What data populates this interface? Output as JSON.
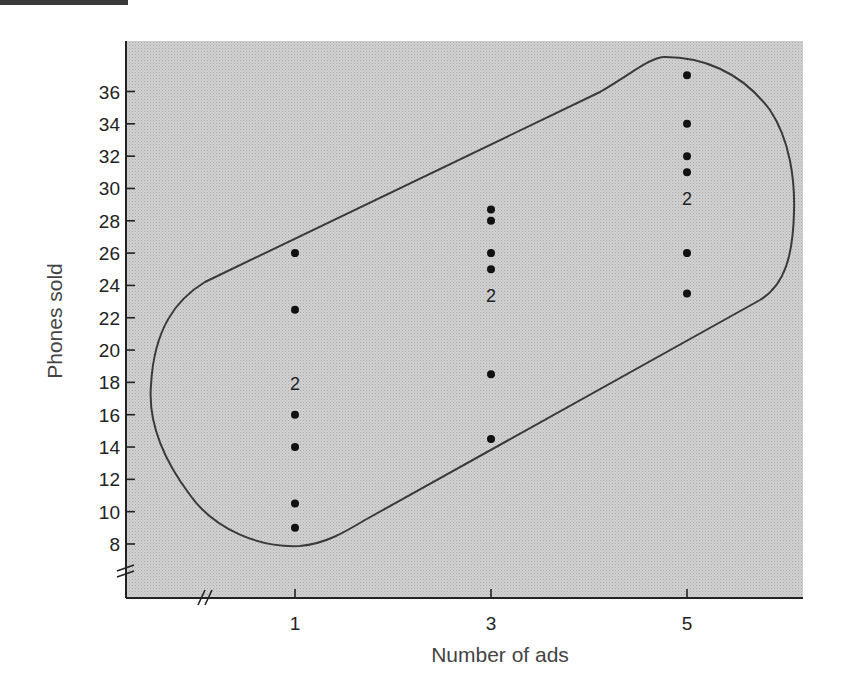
{
  "chart_data": {
    "type": "scatter",
    "title": "",
    "xlabel": "Number of ads",
    "ylabel": "Phones sold",
    "x_ticks": [
      1,
      3,
      5
    ],
    "y_ticks": [
      8,
      10,
      12,
      14,
      16,
      18,
      20,
      22,
      24,
      26,
      28,
      30,
      32,
      34,
      36
    ],
    "xlim": [
      -0.7,
      6.15
    ],
    "ylim": [
      3.4,
      39.1
    ],
    "axis_breaks": {
      "x": true,
      "y": true
    },
    "grid": false,
    "legend": null,
    "background": "stippled gray",
    "enclosure": "rounded oval outline enclosing all points, tilted upward to the right",
    "points": [
      {
        "x": 1,
        "y": 26,
        "count": 1
      },
      {
        "x": 1,
        "y": 22.5,
        "count": 1
      },
      {
        "x": 1,
        "y": 18,
        "count": 2
      },
      {
        "x": 1,
        "y": 16,
        "count": 1
      },
      {
        "x": 1,
        "y": 14,
        "count": 1
      },
      {
        "x": 1,
        "y": 10.5,
        "count": 1
      },
      {
        "x": 1,
        "y": 9,
        "count": 1
      },
      {
        "x": 3,
        "y": 28.7,
        "count": 1
      },
      {
        "x": 3,
        "y": 28,
        "count": 1
      },
      {
        "x": 3,
        "y": 26,
        "count": 1
      },
      {
        "x": 3,
        "y": 25,
        "count": 1
      },
      {
        "x": 3,
        "y": 23.5,
        "count": 2
      },
      {
        "x": 3,
        "y": 18.5,
        "count": 1
      },
      {
        "x": 3,
        "y": 14.5,
        "count": 1
      },
      {
        "x": 5,
        "y": 37,
        "count": 1
      },
      {
        "x": 5,
        "y": 34,
        "count": 1
      },
      {
        "x": 5,
        "y": 32,
        "count": 1
      },
      {
        "x": 5,
        "y": 31,
        "count": 1
      },
      {
        "x": 5,
        "y": 29.5,
        "count": 2
      },
      {
        "x": 5,
        "y": 26,
        "count": 1
      },
      {
        "x": 5,
        "y": 23.5,
        "count": 1
      }
    ],
    "annotations": [
      "2",
      "2",
      "2"
    ]
  },
  "colors": {
    "plot_fill": "#c9c9c9",
    "axis": "#222222",
    "oval": "#3a3a3a",
    "point": "#111111"
  }
}
